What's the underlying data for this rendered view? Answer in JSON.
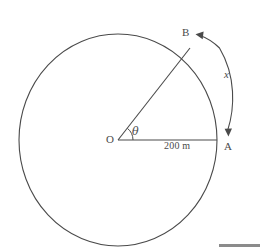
{
  "figure": {
    "type": "geometry-diagram",
    "stroke_color": "#4a4a4a",
    "background_color": "#ffffff",
    "labels": {
      "centre": "O",
      "point_a": "A",
      "point_b": "B",
      "angle": "θ",
      "arc": "x",
      "radius": "200 m"
    },
    "geometry": {
      "centre_x": 118,
      "centre_y": 140,
      "radius_x": 99,
      "radius_y": 106,
      "point_a_x": 217,
      "point_a_y": 140,
      "point_b_x": 190,
      "point_b_y": 48,
      "angle_marker_radius": 14,
      "arc_arrow_start_x": 228,
      "arc_arrow_start_y": 133,
      "arc_arrow_end_x": 197,
      "arc_arrow_end_y": 36
    }
  },
  "artifact": {
    "bottom_bar_color": "#777777"
  }
}
